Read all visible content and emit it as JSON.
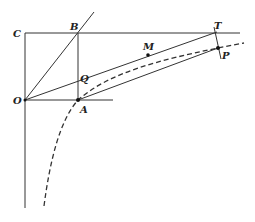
{
  "diagram": {
    "labels": {
      "C": "C",
      "B": "B",
      "O": "O",
      "Q": "Q",
      "A": "A",
      "M": "M",
      "T": "T",
      "P": "P"
    },
    "colors": {
      "line": "#333333",
      "point": "#111111",
      "background": "#ffffff"
    }
  }
}
